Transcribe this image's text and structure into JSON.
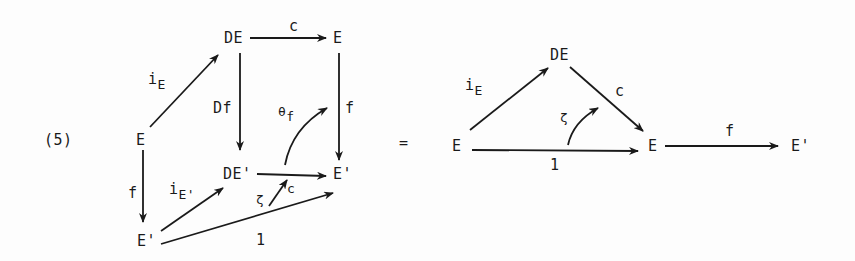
{
  "equation_number": "(5)",
  "equals": "=",
  "left_diagram": {
    "objects": {
      "E_src": "E",
      "DE": "DE",
      "E_top": "E",
      "DE_prime": "DE'",
      "E_prime_right": "E'",
      "E_prime_bottom": "E'"
    },
    "morphisms": {
      "iE": {
        "main": "i",
        "sub": "E"
      },
      "c_top": "c",
      "Df": "Df",
      "f_right": "f",
      "theta_f": {
        "main": "θ",
        "sub": "f"
      },
      "f_left": "f",
      "iE_prime": {
        "main": "i",
        "sub": "E'"
      },
      "c_bottom": "c",
      "zeta": "ζ",
      "one": "1"
    }
  },
  "right_diagram": {
    "objects": {
      "E_src": "E",
      "DE": "DE",
      "E_mid": "E",
      "E_prime": "E'"
    },
    "morphisms": {
      "iE": {
        "main": "i",
        "sub": "E"
      },
      "c": "c",
      "zeta": "ζ",
      "one": "1",
      "f": "f"
    }
  }
}
